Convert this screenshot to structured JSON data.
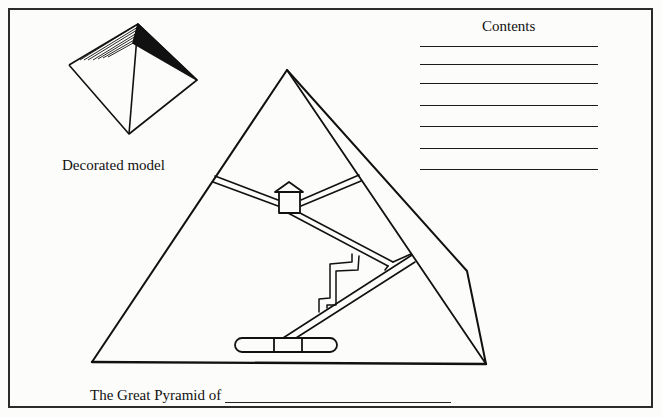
{
  "worksheet": {
    "model_label": "Decorated model",
    "contents_title": "Contents",
    "contents_lines": [
      {
        "value": "",
        "top": 0
      },
      {
        "value": "",
        "top": 18
      },
      {
        "value": "",
        "top": 37
      },
      {
        "value": "",
        "top": 59
      },
      {
        "value": "",
        "top": 80
      },
      {
        "value": "",
        "top": 102
      },
      {
        "value": "",
        "top": 123
      }
    ],
    "caption_prefix": "The Great Pyramid of",
    "caption_blank": "",
    "diagram": {
      "name": "Great Pyramid cross-section",
      "parts": [
        "King's Chamber",
        "Queen's Chamber passage",
        "Grand Gallery",
        "Ascending passage",
        "Descending passage",
        "Subterranean chamber"
      ]
    },
    "colors": {
      "ink": "#111111",
      "paper": "#fcfcfa",
      "frame": "#2b2b2b"
    }
  }
}
